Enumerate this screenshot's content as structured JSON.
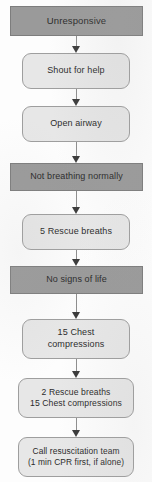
{
  "chart_data": {
    "type": "diagram",
    "layout": "vertical-flowchart",
    "colors": {
      "state_fill": "#9a9a9a",
      "state_border": "#7d7d7d",
      "action_fill": "#e7e7e7",
      "action_border": "#9e9e9e",
      "arrow": "#3a3a3a",
      "text": "#2b2b2b",
      "background": "#fdfdfd"
    },
    "nodes": [
      {
        "id": "unresponsive",
        "label": "Unresponsive",
        "shape": "rectangle",
        "style": "state",
        "x": 10,
        "y": 6,
        "width": 133,
        "height": 30,
        "font_size": 9.5
      },
      {
        "id": "shout-for-help",
        "label": "Shout for help",
        "shape": "rounded-rectangle",
        "style": "action",
        "x": 22,
        "y": 53,
        "width": 108,
        "height": 36,
        "font_size": 9
      },
      {
        "id": "open-airway",
        "label": "Open airway",
        "shape": "rounded-rectangle",
        "style": "action",
        "x": 22,
        "y": 106,
        "width": 108,
        "height": 36,
        "font_size": 9
      },
      {
        "id": "not-breathing-normally",
        "label": "Not breathing normally",
        "shape": "rectangle",
        "style": "state",
        "x": 10,
        "y": 163,
        "width": 133,
        "height": 28,
        "font_size": 9
      },
      {
        "id": "five-rescue-breaths",
        "label": "5 Rescue breaths",
        "shape": "rounded-rectangle",
        "style": "action",
        "x": 22,
        "y": 214,
        "width": 108,
        "height": 36,
        "font_size": 9
      },
      {
        "id": "no-signs-of-life",
        "label": "No signs of life",
        "shape": "rectangle",
        "style": "state",
        "x": 10,
        "y": 266,
        "width": 133,
        "height": 28,
        "font_size": 9
      },
      {
        "id": "15-chest-compressions",
        "label": "15 Chest\ncompressions",
        "shape": "rounded-rectangle",
        "style": "action",
        "x": 22,
        "y": 319,
        "width": 108,
        "height": 40,
        "font_size": 9
      },
      {
        "id": "2-breaths-15-compressions",
        "label": "2 Rescue breaths\n15 Chest compressions",
        "shape": "rounded-rectangle",
        "style": "action",
        "x": 18,
        "y": 378,
        "width": 116,
        "height": 40,
        "font_size": 8.6
      },
      {
        "id": "call-resuscitation-team",
        "label": "Call resuscitation team\n(1 min CPR first, if alone)",
        "shape": "rounded-rectangle",
        "style": "action",
        "x": 18,
        "y": 437,
        "width": 116,
        "height": 40,
        "font_size": 8.4
      }
    ],
    "edges": [
      {
        "id": "edge-1",
        "from": "unresponsive",
        "to": "shout-for-help",
        "arrow": "down",
        "x": 76,
        "y": 36,
        "length": 17
      },
      {
        "id": "edge-2",
        "from": "shout-for-help",
        "to": "open-airway",
        "arrow": "down",
        "x": 76,
        "y": 89,
        "length": 17
      },
      {
        "id": "edge-3",
        "from": "open-airway",
        "to": "not-breathing-normally",
        "arrow": "down",
        "x": 76,
        "y": 142,
        "length": 21
      },
      {
        "id": "edge-4",
        "from": "not-breathing-normally",
        "to": "five-rescue-breaths",
        "arrow": "down",
        "x": 76,
        "y": 191,
        "length": 23
      },
      {
        "id": "edge-5",
        "from": "five-rescue-breaths",
        "to": "no-signs-of-life",
        "arrow": "down",
        "x": 76,
        "y": 250,
        "length": 16
      },
      {
        "id": "edge-6",
        "from": "no-signs-of-life",
        "to": "15-chest-compressions",
        "arrow": "down",
        "x": 76,
        "y": 294,
        "length": 25
      },
      {
        "id": "edge-7",
        "from": "15-chest-compressions",
        "to": "2-breaths-15-compressions",
        "arrow": "down",
        "x": 76,
        "y": 359,
        "length": 19
      },
      {
        "id": "edge-8",
        "from": "2-breaths-15-compressions",
        "to": "call-resuscitation-team",
        "arrow": "down",
        "x": 76,
        "y": 418,
        "length": 19
      }
    ]
  }
}
